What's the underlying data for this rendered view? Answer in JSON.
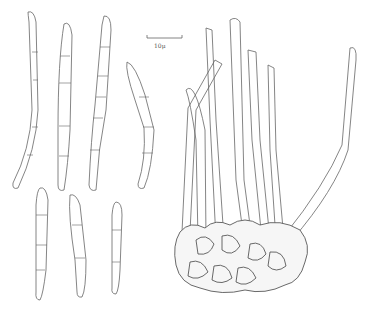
{
  "figure": {
    "scale_bar": {
      "label": "10μ"
    },
    "colors": {
      "line": "#555555",
      "background": "#ffffff"
    }
  }
}
